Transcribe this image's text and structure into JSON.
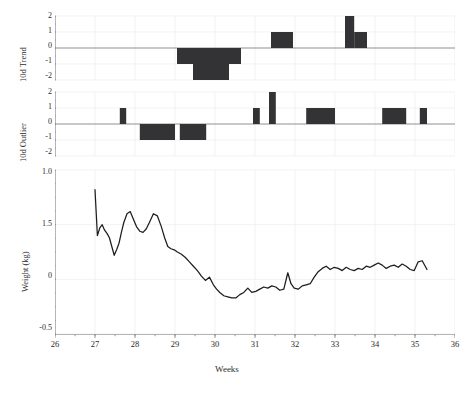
{
  "figure": {
    "background": "#ffffff",
    "bar_color": "#333335",
    "line_color": "#1d1d1f",
    "grid_color": "#ececed",
    "axis_color": "#9a9a9a"
  },
  "chart_data": [
    {
      "type": "bar",
      "name": "10d-trend",
      "title": "",
      "xlabel": "",
      "ylabel": "10d Trend",
      "xlim": [
        26,
        36
      ],
      "ylim": [
        -2,
        2
      ],
      "yticks": [
        2,
        1,
        0,
        -1,
        -2
      ],
      "ytick_labels": [
        "2",
        "1",
        "0",
        "-1",
        "-2"
      ],
      "xticks": [
        26,
        27,
        28,
        29,
        30,
        31,
        32,
        33,
        34,
        35,
        36
      ],
      "grid": true,
      "legend": "none",
      "bars": [
        {
          "x0": 29.05,
          "x1": 29.45,
          "value": -1
        },
        {
          "x0": 29.45,
          "x1": 30.35,
          "value": -2
        },
        {
          "x0": 30.35,
          "x1": 30.65,
          "value": -1
        },
        {
          "x0": 31.4,
          "x1": 31.95,
          "value": 1
        },
        {
          "x0": 33.25,
          "x1": 33.48,
          "value": 2
        },
        {
          "x0": 33.48,
          "x1": 33.8,
          "value": 1
        }
      ]
    },
    {
      "type": "bar",
      "name": "10d-outlier",
      "title": "",
      "xlabel": "",
      "ylabel": "10d Outlier",
      "xlim": [
        26,
        36
      ],
      "ylim": [
        -2,
        2
      ],
      "yticks": [
        2,
        1,
        0,
        -1,
        -2
      ],
      "ytick_labels": [
        "2",
        "1",
        "0",
        "-1",
        "-2"
      ],
      "xticks": [
        26,
        27,
        28,
        29,
        30,
        31,
        32,
        33,
        34,
        35,
        36
      ],
      "grid": true,
      "legend": "none",
      "bars": [
        {
          "x0": 27.62,
          "x1": 27.78,
          "value": 1
        },
        {
          "x0": 28.12,
          "x1": 29.0,
          "value": -1
        },
        {
          "x0": 29.12,
          "x1": 29.78,
          "value": -1
        },
        {
          "x0": 30.95,
          "x1": 31.12,
          "value": 1
        },
        {
          "x0": 31.35,
          "x1": 31.52,
          "value": 2
        },
        {
          "x0": 32.28,
          "x1": 33.0,
          "value": 1
        },
        {
          "x0": 34.18,
          "x1": 34.78,
          "value": 1
        },
        {
          "x0": 35.12,
          "x1": 35.3,
          "value": 1
        }
      ]
    },
    {
      "type": "line",
      "name": "weight-series",
      "title": "",
      "xlabel": "Weeks",
      "ylabel": "Weight (kg)",
      "xlim": [
        26,
        36
      ],
      "ylim": [
        -0.5,
        1.0
      ],
      "yticks": [
        1.0,
        0.5,
        0.0,
        -0.5
      ],
      "ytick_labels": [
        "1.0",
        "1.5",
        "0",
        "-0.5"
      ],
      "xticks": [
        26,
        27,
        28,
        29,
        30,
        31,
        32,
        33,
        34,
        35,
        36
      ],
      "xtick_labels": [
        "26",
        "27",
        "28",
        "29",
        "30",
        "31",
        "32",
        "33",
        "34",
        "35",
        "36"
      ],
      "grid": true,
      "legend": "none",
      "x": [
        27.0,
        27.06,
        27.12,
        27.18,
        27.24,
        27.3,
        27.36,
        27.42,
        27.48,
        27.54,
        27.6,
        27.66,
        27.72,
        27.8,
        27.88,
        27.96,
        28.04,
        28.12,
        28.2,
        28.28,
        28.36,
        28.46,
        28.56,
        28.66,
        28.74,
        28.82,
        28.9,
        28.98,
        29.06,
        29.16,
        29.26,
        29.36,
        29.46,
        29.56,
        29.66,
        29.76,
        29.86,
        29.96,
        30.04,
        30.12,
        30.22,
        30.32,
        30.42,
        30.52,
        30.62,
        30.72,
        30.82,
        30.92,
        31.02,
        31.12,
        31.22,
        31.32,
        31.42,
        31.52,
        31.62,
        31.72,
        31.82,
        31.9,
        31.98,
        32.08,
        32.18,
        32.28,
        32.38,
        32.48,
        32.58,
        32.68,
        32.78,
        32.88,
        32.98,
        33.08,
        33.18,
        33.28,
        33.38,
        33.48,
        33.58,
        33.68,
        33.78,
        33.88,
        33.98,
        34.08,
        34.18,
        34.28,
        34.38,
        34.48,
        34.58,
        34.68,
        34.78,
        34.88,
        34.98,
        35.08,
        35.18,
        35.3
      ],
      "y": [
        0.82,
        0.4,
        0.47,
        0.5,
        0.45,
        0.42,
        0.38,
        0.3,
        0.22,
        0.27,
        0.33,
        0.43,
        0.52,
        0.6,
        0.62,
        0.55,
        0.48,
        0.44,
        0.43,
        0.46,
        0.52,
        0.6,
        0.58,
        0.48,
        0.38,
        0.3,
        0.28,
        0.27,
        0.25,
        0.23,
        0.2,
        0.16,
        0.12,
        0.08,
        0.03,
        -0.01,
        0.02,
        -0.05,
        -0.09,
        -0.12,
        -0.15,
        -0.16,
        -0.17,
        -0.17,
        -0.14,
        -0.12,
        -0.08,
        -0.12,
        -0.11,
        -0.09,
        -0.07,
        -0.08,
        -0.06,
        -0.07,
        -0.1,
        -0.09,
        0.06,
        -0.04,
        -0.08,
        -0.09,
        -0.06,
        -0.05,
        -0.04,
        0.02,
        0.07,
        0.1,
        0.12,
        0.09,
        0.11,
        0.1,
        0.08,
        0.11,
        0.09,
        0.08,
        0.1,
        0.09,
        0.12,
        0.11,
        0.13,
        0.15,
        0.13,
        0.1,
        0.12,
        0.13,
        0.11,
        0.14,
        0.12,
        0.09,
        0.08,
        0.16,
        0.17,
        0.09
      ]
    }
  ]
}
